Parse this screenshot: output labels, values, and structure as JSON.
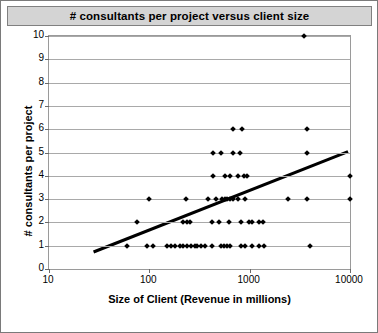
{
  "window": {
    "title": "# consultants per project versus client size"
  },
  "chart_data": {
    "type": "scatter",
    "title": "# consultants per project versus client size",
    "xlabel": "Size of Client (Revenue in millions)",
    "ylabel": "# consultants per project",
    "xscale": "log",
    "yscale": "linear",
    "xlim": [
      10,
      10000
    ],
    "ylim": [
      0,
      10
    ],
    "xticks": [
      10,
      100,
      1000,
      10000
    ],
    "xtick_labels": [
      "10",
      "100",
      "1000",
      "10000"
    ],
    "yticks": [
      0,
      1,
      2,
      3,
      4,
      5,
      6,
      7,
      8,
      9,
      10
    ],
    "ytick_labels": [
      "0",
      "1",
      "2",
      "3",
      "4",
      "5",
      "6",
      "7",
      "8",
      "9",
      "10"
    ],
    "grid": "horizontal",
    "legend": "none",
    "marker_color": "#000000",
    "marker_shape": "diamond",
    "trendline": {
      "present": true,
      "color": "#000000",
      "style": "solid",
      "x_start": 28,
      "y_start": 0.65,
      "x_end": 10000,
      "y_end": 5.0
    },
    "points": [
      {
        "x": 60,
        "y": 1
      },
      {
        "x": 95,
        "y": 1
      },
      {
        "x": 110,
        "y": 1
      },
      {
        "x": 150,
        "y": 1
      },
      {
        "x": 165,
        "y": 1
      },
      {
        "x": 180,
        "y": 1
      },
      {
        "x": 200,
        "y": 1
      },
      {
        "x": 215,
        "y": 1
      },
      {
        "x": 240,
        "y": 1
      },
      {
        "x": 260,
        "y": 1
      },
      {
        "x": 285,
        "y": 1
      },
      {
        "x": 300,
        "y": 1
      },
      {
        "x": 330,
        "y": 1
      },
      {
        "x": 360,
        "y": 1
      },
      {
        "x": 420,
        "y": 1
      },
      {
        "x": 520,
        "y": 1
      },
      {
        "x": 560,
        "y": 1
      },
      {
        "x": 600,
        "y": 1
      },
      {
        "x": 640,
        "y": 1
      },
      {
        "x": 820,
        "y": 1
      },
      {
        "x": 900,
        "y": 1
      },
      {
        "x": 1050,
        "y": 1
      },
      {
        "x": 1250,
        "y": 1
      },
      {
        "x": 1400,
        "y": 1
      },
      {
        "x": 4000,
        "y": 1
      },
      {
        "x": 75,
        "y": 2
      },
      {
        "x": 215,
        "y": 2
      },
      {
        "x": 235,
        "y": 2
      },
      {
        "x": 255,
        "y": 2
      },
      {
        "x": 420,
        "y": 2
      },
      {
        "x": 500,
        "y": 2
      },
      {
        "x": 620,
        "y": 2
      },
      {
        "x": 820,
        "y": 2
      },
      {
        "x": 980,
        "y": 2
      },
      {
        "x": 1050,
        "y": 2
      },
      {
        "x": 1250,
        "y": 2
      },
      {
        "x": 1350,
        "y": 2
      },
      {
        "x": 100,
        "y": 3
      },
      {
        "x": 230,
        "y": 3
      },
      {
        "x": 380,
        "y": 3
      },
      {
        "x": 460,
        "y": 3
      },
      {
        "x": 530,
        "y": 3
      },
      {
        "x": 570,
        "y": 3
      },
      {
        "x": 600,
        "y": 3
      },
      {
        "x": 640,
        "y": 3
      },
      {
        "x": 680,
        "y": 3
      },
      {
        "x": 760,
        "y": 3
      },
      {
        "x": 900,
        "y": 3
      },
      {
        "x": 2400,
        "y": 3
      },
      {
        "x": 3700,
        "y": 3
      },
      {
        "x": 10000,
        "y": 3
      },
      {
        "x": 430,
        "y": 4
      },
      {
        "x": 570,
        "y": 4
      },
      {
        "x": 640,
        "y": 4
      },
      {
        "x": 760,
        "y": 4
      },
      {
        "x": 880,
        "y": 4
      },
      {
        "x": 930,
        "y": 4
      },
      {
        "x": 10000,
        "y": 4
      },
      {
        "x": 430,
        "y": 5
      },
      {
        "x": 520,
        "y": 5
      },
      {
        "x": 680,
        "y": 5
      },
      {
        "x": 810,
        "y": 5
      },
      {
        "x": 3700,
        "y": 5
      },
      {
        "x": 680,
        "y": 6
      },
      {
        "x": 830,
        "y": 6
      },
      {
        "x": 3700,
        "y": 6
      },
      {
        "x": 3500,
        "y": 10
      }
    ]
  }
}
